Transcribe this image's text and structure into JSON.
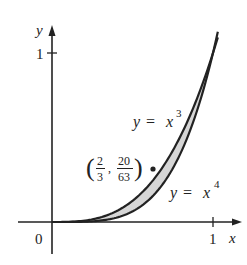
{
  "figure": {
    "axes": {
      "x_label": "x",
      "y_label": "y",
      "origin_label": "0",
      "x_tick_label": "1",
      "y_tick_label": "1"
    },
    "curves": [
      {
        "name": "cubic",
        "equation_lhs": "y",
        "equation_eq": "=",
        "equation_base": "x",
        "equation_exp": "3"
      },
      {
        "name": "quartic",
        "equation_lhs": "y",
        "equation_eq": "=",
        "equation_base": "x",
        "equation_exp": "4"
      }
    ],
    "point": {
      "x_num": "2",
      "x_den": "3",
      "y_num": "20",
      "y_den": "63",
      "separator": ",",
      "open_paren": "(",
      "close_paren": ")"
    },
    "colors": {
      "stroke": "#222222",
      "shade": "#d6d6d6",
      "background": "#ffffff"
    }
  },
  "chart_data": {
    "type": "line",
    "title": "",
    "xlabel": "x",
    "ylabel": "y",
    "xlim": [
      -0.2,
      1.15
    ],
    "ylim": [
      -0.2,
      1.15
    ],
    "grid": false,
    "series": [
      {
        "name": "y = x^3",
        "function": "x^3",
        "domain": [
          0,
          1.03
        ]
      },
      {
        "name": "y = x^4",
        "function": "x^4",
        "domain": [
          0,
          1.03
        ]
      }
    ],
    "shaded_region": "between y = x^3 and y = x^4 for 0 <= x <= 1",
    "annotations": [
      {
        "text": "(2/3, 20/63)",
        "x": 0.6667,
        "y": 0.3175,
        "marker": "dot"
      },
      {
        "text": "y = x^3"
      },
      {
        "text": "y = x^4"
      }
    ],
    "ticks": {
      "x": [
        1
      ],
      "y": [
        1
      ]
    }
  }
}
